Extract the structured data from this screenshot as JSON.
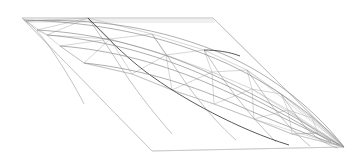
{
  "figure": {
    "type": "line-art-geometry",
    "background_color": "#ffffff",
    "canvas": {
      "width": 356,
      "height": 168
    }
  },
  "palette": {
    "frame_stroke": "#c9c9c9",
    "mesh_stroke": "#b4b4b4",
    "mesh_mid_stroke": "#9a9a9a",
    "iso_stroke": "#8c8c8c",
    "iso_dark_stroke": "#3a3a3a",
    "boundary_stroke": "#6e6e6e",
    "fan_stroke": "#bdbdbd"
  },
  "chart_data": {
    "type": "scatter",
    "xlabel": "",
    "ylabel": "",
    "grid": false,
    "legend": null,
    "xlim": [
      0,
      356
    ],
    "ylim": [
      168,
      0
    ],
    "annotations": [],
    "frame_parallelogram": {
      "label": "ground parallelogram",
      "points": "22,18 213,18 344,147 152,151"
    },
    "frame_inner_offsets": [
      "24,20 214,20",
      "26,22 215,22"
    ],
    "apex_point": {
      "x": 344,
      "y": 147,
      "label": "convergence vertex"
    },
    "iso_curves": [
      {
        "name": "iso-0-top-boundary",
        "dark": false,
        "path": "M 26,21 C 90,18 160,26 230,57 C 285,82 325,122 344,147"
      },
      {
        "name": "iso-1",
        "dark": false,
        "path": "M 24,20 C 92,22 162,34 228,64 C 283,90 326,126 344,147"
      },
      {
        "name": "iso-2-ridge",
        "dark": true,
        "path": "M 88,18 C 104,34 122,54 146,72 C 182,99 240,130 289,145"
      },
      {
        "name": "iso-3",
        "dark": false,
        "path": "M 47,35 C 96,39 150,52 201,74 C 252,96 302,124 331,142"
      },
      {
        "name": "iso-4-mid",
        "dark": false,
        "path": "M 37,30 C 92,33 148,46 200,69 C 254,93 308,124 338,144"
      },
      {
        "name": "iso-5-lower",
        "dark": false,
        "path": "M 60,46 C 112,50 164,64 214,86 C 264,108 312,132 340,145"
      },
      {
        "name": "iso-6-bottom-boundary",
        "dark": false,
        "path": "M 84,63 C 134,68 184,82 232,103 C 280,124 322,140 344,147"
      },
      {
        "name": "iso-dark-segment-right",
        "dark": true,
        "path": "M 204,50 C 216,50 230,52 240,56"
      }
    ],
    "cross_curves": [
      {
        "name": "cross-a",
        "path": "M 26,21 C 34,27 42,36 51,49 C 64,68 76,88 84,104"
      },
      {
        "name": "cross-b",
        "path": "M 88,18 C 98,32 110,50 124,72 C 140,96 158,118 172,134"
      },
      {
        "name": "cross-c",
        "path": "M 152,34 C 162,48 174,66 188,86 C 204,108 222,128 236,140"
      },
      {
        "name": "cross-d",
        "path": "M 204,50 C 212,62 222,78 234,94 C 248,112 264,130 276,142"
      },
      {
        "name": "cross-e",
        "path": "M 247,70 C 254,80 262,92 272,106 C 286,124 300,138 310,146"
      },
      {
        "name": "cross-f",
        "path": "M 281,94 C 288,104 296,116 306,128 C 318,140 330,146 338,148"
      }
    ],
    "mesh_edges": [
      "M 26,21 L 88,18",
      "M 88,18 L 152,34",
      "M 152,34 L 204,50",
      "M 204,50 L 247,70",
      "M 247,70 L 281,94",
      "M 281,94 L 312,118",
      "M 312,118 L 344,147",
      "M 24,20 L 47,35",
      "M 47,35 L 37,30",
      "M 37,30 L 88,18",
      "M 47,35 L 88,18",
      "M 47,35 L 110,39",
      "M 110,39 L 88,18",
      "M 110,39 L 152,34",
      "M 110,39 L 166,55",
      "M 166,55 L 152,34",
      "M 166,55 L 204,50",
      "M 166,55 L 212,72",
      "M 212,72 L 204,50",
      "M 212,72 L 247,70",
      "M 212,72 L 252,89",
      "M 252,89 L 247,70",
      "M 252,89 L 281,94",
      "M 252,89 L 288,110",
      "M 288,110 L 281,94",
      "M 288,110 L 312,118",
      "M 288,110 L 318,133",
      "M 318,133 L 312,118",
      "M 318,133 L 344,147",
      "M 60,46 L 110,39",
      "M 60,46 L 47,35",
      "M 60,46 L 84,63",
      "M 84,63 L 110,39",
      "M 84,63 L 132,74",
      "M 132,74 L 110,39",
      "M 132,74 L 166,55",
      "M 132,74 L 172,90",
      "M 172,90 L 166,55",
      "M 172,90 L 212,72",
      "M 172,90 L 214,104",
      "M 214,104 L 212,72",
      "M 214,104 L 252,89",
      "M 214,104 L 254,119",
      "M 254,119 L 252,89",
      "M 254,119 L 288,110",
      "M 254,119 L 292,134",
      "M 292,134 L 288,110",
      "M 292,134 L 318,133",
      "M 292,134 L 344,147",
      "M 318,133 L 292,134",
      "M 84,63 L 60,46",
      "M 132,74 L 84,63",
      "M 172,90 L 132,74",
      "M 214,104 L 172,90",
      "M 254,119 L 214,104",
      "M 292,134 L 254,119",
      "M 22,18 L 26,21",
      "M 22,18 L 24,20",
      "M 22,18 L 152,151",
      "M 152,151 L 344,147",
      "M 213,18 L 344,147",
      "M 22,18 L 213,18"
    ],
    "fan_lines": [
      "M 344,147 L 312,118",
      "M 344,147 L 318,133",
      "M 344,147 L 292,134",
      "M 344,147 L 288,110",
      "M 344,147 L 281,94",
      "M 344,147 L 254,119",
      "M 344,147 L 252,89",
      "M 344,147 L 247,70",
      "M 344,147 L 213,18"
    ]
  }
}
